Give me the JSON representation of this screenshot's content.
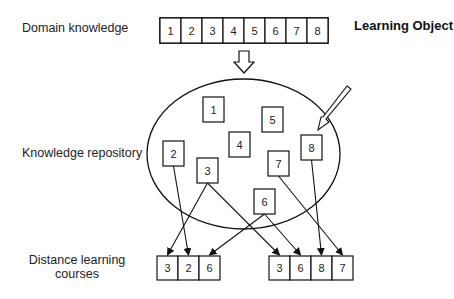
{
  "labels": {
    "domain_knowledge": "Domain knowledge",
    "knowledge_repository": "Knowledge repository",
    "distance_learning_courses": "Distance learning courses",
    "learning_object": "Learning Object"
  },
  "domain_knowledge_cells": [
    "1",
    "2",
    "3",
    "4",
    "5",
    "6",
    "7",
    "8"
  ],
  "repository_objects": [
    {
      "id": "1",
      "x": 203,
      "y": 97
    },
    {
      "id": "5",
      "x": 262,
      "y": 107
    },
    {
      "id": "4",
      "x": 229,
      "y": 132
    },
    {
      "id": "8",
      "x": 301,
      "y": 135
    },
    {
      "id": "2",
      "x": 163,
      "y": 141
    },
    {
      "id": "7",
      "x": 268,
      "y": 151
    },
    {
      "id": "3",
      "x": 197,
      "y": 158
    },
    {
      "id": "6",
      "x": 254,
      "y": 189
    }
  ],
  "courses": [
    {
      "name": "course-1",
      "cells": [
        "3",
        "2",
        "6"
      ]
    },
    {
      "name": "course-2",
      "cells": [
        "3",
        "6",
        "8",
        "7"
      ]
    }
  ],
  "connections": [
    {
      "from": "3",
      "to_course": 0,
      "to_cell": 0
    },
    {
      "from": "2",
      "to_course": 0,
      "to_cell": 1
    },
    {
      "from": "6",
      "to_course": 0,
      "to_cell": 2
    },
    {
      "from": "3",
      "to_course": 1,
      "to_cell": 0
    },
    {
      "from": "6",
      "to_course": 1,
      "to_cell": 1
    },
    {
      "from": "8",
      "to_course": 1,
      "to_cell": 2
    },
    {
      "from": "7",
      "to_course": 1,
      "to_cell": 3
    }
  ]
}
